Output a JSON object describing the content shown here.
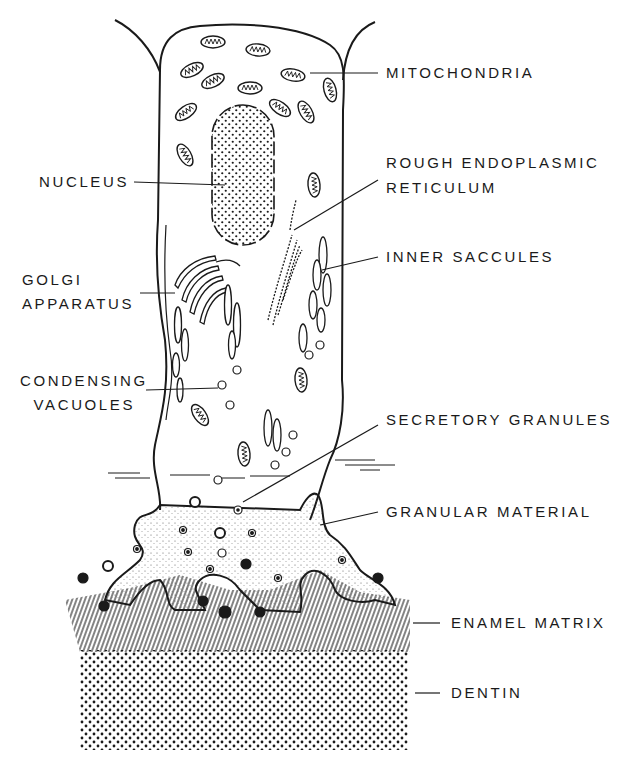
{
  "diagram": {
    "colors": {
      "ink": "#1a1a1a",
      "background": "#ffffff"
    },
    "labels_right": [
      {
        "id": "mitochondria",
        "text": "MITOCHONDRIA"
      },
      {
        "id": "rer_line1",
        "text": "ROUGH ENDOPLASMIC"
      },
      {
        "id": "rer_line2",
        "text": "RETICULUM"
      },
      {
        "id": "inner_saccules",
        "text": "INNER SACCULES"
      },
      {
        "id": "secretory_granules",
        "text": "SECRETORY GRANULES"
      },
      {
        "id": "granular_material",
        "text": "GRANULAR MATERIAL"
      },
      {
        "id": "enamel_matrix",
        "text": "ENAMEL MATRIX"
      },
      {
        "id": "dentin",
        "text": "DENTIN"
      }
    ],
    "labels_left": [
      {
        "id": "nucleus",
        "text": "NUCLEUS"
      },
      {
        "id": "golgi_line1",
        "text": "GOLGI"
      },
      {
        "id": "golgi_line2",
        "text": "APPARATUS"
      },
      {
        "id": "condensing_line1",
        "text": "CONDENSING"
      },
      {
        "id": "condensing_line2",
        "text": "VACUOLES"
      }
    ]
  }
}
